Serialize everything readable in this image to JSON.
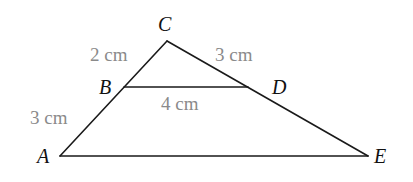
{
  "diagram": {
    "type": "geometry-similar-triangles",
    "vertices": {
      "A": {
        "label": "A",
        "x": 60,
        "y": 156
      },
      "B": {
        "label": "B",
        "x": 124,
        "y": 87
      },
      "C": {
        "label": "C",
        "x": 167,
        "y": 41
      },
      "D": {
        "label": "D",
        "x": 248,
        "y": 87
      },
      "E": {
        "label": "E",
        "x": 368,
        "y": 156
      }
    },
    "segments": [
      {
        "from": "A",
        "to": "C"
      },
      {
        "from": "C",
        "to": "E"
      },
      {
        "from": "A",
        "to": "E"
      },
      {
        "from": "B",
        "to": "D"
      }
    ],
    "measurements": {
      "CB": "2 cm",
      "CD": "3 cm",
      "BD": "4 cm",
      "BA": "3 cm"
    },
    "colors": {
      "lines": "#1a1a1a",
      "vertex_labels": "#111111",
      "measurement_labels": "#8a8a8a"
    }
  }
}
